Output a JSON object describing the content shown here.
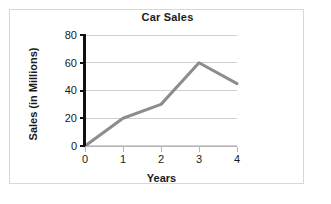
{
  "figure": {
    "background_color": "#ffffff",
    "frame_color": "#d8d8d8"
  },
  "chart_data": {
    "type": "line",
    "title": "Car Sales",
    "xlabel": "Years",
    "ylabel": "Sales (in Millions)",
    "x": [
      0,
      1,
      2,
      3,
      4
    ],
    "values": [
      0,
      20,
      30,
      60,
      45
    ],
    "categories": [
      "0",
      "1",
      "2",
      "3",
      "4"
    ],
    "xlim": [
      0,
      4
    ],
    "ylim": [
      0,
      80
    ],
    "x_tick_labels": [
      "0",
      "1",
      "2",
      "3",
      "4"
    ],
    "y_tick_labels": [
      "0",
      "20",
      "40",
      "60",
      "80"
    ],
    "y_ticks": [
      0,
      20,
      40,
      60,
      80
    ],
    "grid": "horizontal",
    "legend": "none",
    "line_color": "#8c8c8c",
    "line_width": 3,
    "markers": "none",
    "axis_color": "#111111",
    "gridline_color": "#cfcfcf"
  }
}
